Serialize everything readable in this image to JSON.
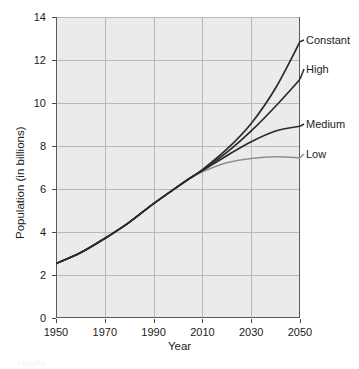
{
  "chart_data": {
    "type": "line",
    "title": "",
    "xlabel": "Year",
    "ylabel": "Population (in billions)",
    "xlim": [
      1950,
      2050
    ],
    "ylim": [
      0,
      14
    ],
    "grid": true,
    "legend_position": "right-of-plot (inline end labels)",
    "x_ticks": [
      "1950",
      "1970",
      "1990",
      "2010",
      "2030",
      "2050"
    ],
    "x_tick_values": [
      1950,
      1970,
      1990,
      2010,
      2030,
      2050
    ],
    "y_ticks": [
      "0",
      "2",
      "4",
      "6",
      "8",
      "10",
      "12",
      "14"
    ],
    "y_tick_values": [
      0,
      2,
      4,
      6,
      8,
      10,
      12,
      14
    ],
    "x": [
      1950,
      1960,
      1970,
      1980,
      1990,
      2000,
      2005,
      2010,
      2020,
      2030,
      2040,
      2050
    ],
    "series": [
      {
        "name": "Constant",
        "color": "#2b2b2b",
        "values": [
          2.53,
          3.03,
          3.7,
          4.45,
          5.32,
          6.12,
          6.51,
          6.9,
          7.85,
          9.05,
          10.7,
          12.85
        ]
      },
      {
        "name": "High",
        "color": "#2b2b2b",
        "values": [
          2.53,
          3.03,
          3.7,
          4.45,
          5.32,
          6.12,
          6.51,
          6.88,
          7.7,
          8.7,
          9.85,
          11.1
        ]
      },
      {
        "name": "Medium",
        "color": "#2b2b2b",
        "values": [
          2.53,
          3.03,
          3.7,
          4.45,
          5.32,
          6.12,
          6.51,
          6.85,
          7.55,
          8.2,
          8.7,
          8.92
        ]
      },
      {
        "name": "Low",
        "color": "#8f8f8f",
        "values": [
          2.53,
          3.03,
          3.7,
          4.45,
          5.32,
          6.12,
          6.51,
          6.8,
          7.22,
          7.42,
          7.5,
          7.45
        ]
      }
    ],
    "end_labels": [
      {
        "text": "Constant",
        "value": 12.85
      },
      {
        "text": "High",
        "value": 11.1
      },
      {
        "text": "Medium",
        "value": 8.92
      },
      {
        "text": "Low",
        "value": 7.45
      }
    ],
    "plot_background": "#ebebeb",
    "gridline_color": "#b9b9b9",
    "axis_color": "#5a5a5a"
  },
  "caption": {
    "text": "FIGURE"
  }
}
